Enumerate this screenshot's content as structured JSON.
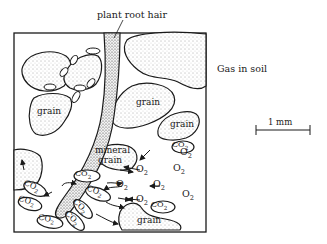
{
  "title": "Gas in soil",
  "labels": {
    "root_hair": "plant root hair",
    "grain": "grain",
    "mineral_grain_line1": "mineral",
    "mineral_grain_line2": "grain"
  },
  "scale_bar": {
    "label": "1 mm"
  },
  "gases": {
    "oxygen": "O",
    "oxygen_sub": "2",
    "carbon_dioxide": "CO",
    "carbon_dioxide_sub": "2"
  },
  "o2_labels": [
    {
      "x": 187,
      "y": 153
    },
    {
      "x": 143,
      "y": 170
    },
    {
      "x": 180,
      "y": 169
    },
    {
      "x": 123,
      "y": 185
    },
    {
      "x": 160,
      "y": 185
    },
    {
      "x": 189,
      "y": 195
    },
    {
      "x": 143,
      "y": 200
    }
  ],
  "co2_labels": [
    {
      "x": 181,
      "y": 147,
      "rot": 0
    },
    {
      "x": 84,
      "y": 176,
      "rot": 0
    },
    {
      "x": 32,
      "y": 188,
      "rot": 25
    },
    {
      "x": 95,
      "y": 193,
      "rot": 20
    },
    {
      "x": 27,
      "y": 203,
      "rot": 15
    },
    {
      "x": 80,
      "y": 208,
      "rot": 45
    },
    {
      "x": 160,
      "y": 207,
      "rot": 0
    },
    {
      "x": 72,
      "y": 220,
      "rot": 45
    },
    {
      "x": 47,
      "y": 221,
      "rot": 10
    }
  ]
}
